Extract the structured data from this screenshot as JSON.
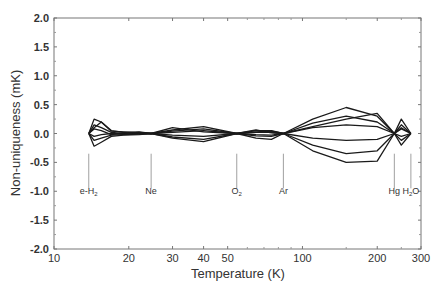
{
  "chart_data": {
    "type": "line",
    "title": "",
    "xlabel": "Temperature (K)",
    "ylabel": "Non-uniqueness (mK)",
    "xscale": "log",
    "xlim": [
      10,
      300
    ],
    "ylim": [
      -2.0,
      2.0
    ],
    "grid": false,
    "legend": null,
    "x_ticks": [
      10,
      20,
      30,
      40,
      50,
      100,
      200,
      300
    ],
    "x_tick_labels": [
      "10",
      "20",
      "30",
      "40",
      "50",
      "100",
      "200",
      "300"
    ],
    "y_ticks": [
      2.0,
      1.5,
      1.0,
      0.5,
      0.0,
      -0.5,
      -1.0,
      -1.5,
      -2.0
    ],
    "y_tick_labels": [
      "2.0",
      "1.5",
      "1.0",
      "0.5",
      "0.0",
      "-0.5",
      "-1.0",
      "-1.5",
      "-2.0"
    ],
    "annotations": [
      {
        "label": "e-H",
        "sub": "2",
        "T": 13.8
      },
      {
        "label": "Ne",
        "sub": "",
        "T": 24.6
      },
      {
        "label": "O",
        "sub": "2",
        "T": 54.4
      },
      {
        "label": "Ar",
        "sub": "",
        "T": 83.8
      },
      {
        "label": "Hg",
        "sub": "",
        "T": 234.3
      },
      {
        "label": "H",
        "sub": "2",
        "T": 273.16,
        "suffix": "O"
      }
    ],
    "series": [
      {
        "name": "curve-1",
        "x": [
          13.8,
          14.5,
          15.5,
          17,
          19,
          22,
          24.6,
          30,
          40,
          54.4,
          65,
          75,
          83.8,
          110,
          150,
          200,
          234.3,
          250,
          273.16
        ],
        "y": [
          0,
          0.25,
          0.2,
          0.05,
          0.02,
          0.03,
          0,
          0.06,
          0.12,
          0,
          0.05,
          0.05,
          0,
          0.25,
          0.45,
          0.3,
          0,
          0.25,
          0
        ]
      },
      {
        "name": "curve-2",
        "x": [
          13.8,
          14.5,
          15.5,
          17,
          19,
          22,
          24.6,
          30,
          40,
          54.4,
          65,
          75,
          83.8,
          110,
          150,
          200,
          234.3,
          250,
          273.16
        ],
        "y": [
          0,
          0.15,
          0.1,
          0.02,
          0,
          0.02,
          0,
          0.04,
          0.08,
          0,
          0.03,
          0.04,
          0,
          0.18,
          0.3,
          0.2,
          0,
          0.15,
          0
        ]
      },
      {
        "name": "curve-3",
        "x": [
          13.8,
          14.5,
          15.5,
          17,
          19,
          22,
          24.6,
          30,
          40,
          54.4,
          65,
          75,
          83.8,
          110,
          150,
          200,
          234.3,
          250,
          273.16
        ],
        "y": [
          0,
          0.08,
          0.05,
          -0.02,
          0.01,
          0,
          0,
          0.02,
          0.05,
          0,
          0.02,
          0.02,
          0,
          0.1,
          0.15,
          0.12,
          0,
          0.08,
          0
        ]
      },
      {
        "name": "curve-4",
        "x": [
          13.8,
          14.5,
          15.5,
          17,
          19,
          22,
          24.6,
          30,
          40,
          54.4,
          65,
          75,
          83.8,
          110,
          150,
          200,
          234.3,
          250,
          273.16
        ],
        "y": [
          0,
          -0.05,
          -0.02,
          0,
          -0.01,
          0,
          0,
          -0.03,
          -0.05,
          0,
          -0.02,
          -0.03,
          0,
          -0.08,
          -0.12,
          -0.1,
          0,
          -0.05,
          0
        ]
      },
      {
        "name": "curve-5",
        "x": [
          13.8,
          14.5,
          15.5,
          17,
          19,
          22,
          24.6,
          30,
          40,
          54.4,
          65,
          75,
          83.8,
          110,
          150,
          200,
          234.3,
          250,
          273.16
        ],
        "y": [
          0,
          -0.12,
          -0.08,
          -0.03,
          -0.02,
          -0.01,
          0,
          -0.06,
          -0.1,
          0,
          -0.04,
          -0.05,
          0,
          -0.2,
          -0.35,
          -0.3,
          0,
          -0.12,
          0
        ]
      },
      {
        "name": "curve-6",
        "x": [
          13.8,
          14.5,
          15.5,
          17,
          19,
          22,
          24.6,
          30,
          40,
          54.4,
          65,
          75,
          83.8,
          110,
          150,
          200,
          234.3,
          250,
          273.16
        ],
        "y": [
          0,
          -0.22,
          -0.15,
          -0.05,
          -0.03,
          -0.02,
          0,
          -0.08,
          -0.14,
          0,
          -0.08,
          -0.1,
          0,
          -0.3,
          -0.5,
          -0.48,
          0,
          -0.2,
          0
        ]
      },
      {
        "name": "curve-7",
        "x": [
          13.8,
          14.5,
          15.5,
          17,
          19,
          22,
          24.6,
          30,
          40,
          54.4,
          65,
          75,
          83.8,
          110,
          150,
          200,
          234.3,
          250,
          273.16
        ],
        "y": [
          0,
          0.1,
          0.2,
          0.04,
          0.03,
          0.01,
          0,
          0.1,
          0.03,
          0,
          0.06,
          0.01,
          0,
          0.12,
          0.25,
          0.35,
          0,
          0.1,
          0
        ]
      }
    ]
  }
}
